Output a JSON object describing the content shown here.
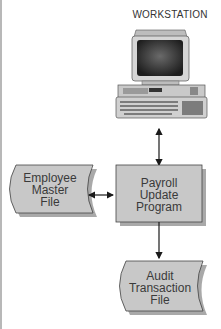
{
  "diagram": {
    "workstation": {
      "label": "WORKSTATION",
      "icon": "desktop-computer-icon"
    },
    "process": {
      "lines": [
        "Payroll",
        "Update",
        "Program"
      ],
      "shape": "rectangle"
    },
    "employee_file": {
      "lines": [
        "Employee",
        "Master",
        "File"
      ],
      "shape": "stored-data"
    },
    "audit_file": {
      "lines": [
        "Audit",
        "Transaction",
        "File"
      ],
      "shape": "stored-data"
    },
    "connections": [
      {
        "from": "workstation",
        "to": "process",
        "direction": "bidirectional"
      },
      {
        "from": "employee_file",
        "to": "process",
        "direction": "bidirectional"
      },
      {
        "from": "process",
        "to": "audit_file",
        "direction": "one-way"
      }
    ],
    "colors": {
      "fill": "#c8c8c8",
      "shadow": "#a9a9a9",
      "stroke": "#444444"
    }
  }
}
